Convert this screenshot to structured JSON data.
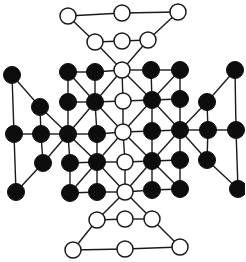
{
  "diagram": {
    "title": "",
    "type": "board-game-layout",
    "colors": {
      "black_piece": "#0d0d0d",
      "white_piece": "#ffffff",
      "line": "#1a1a1a",
      "background": "#ffffff"
    },
    "node_radius": 8,
    "nodes": [
      {
        "id": "t1",
        "x": 68,
        "y": 16,
        "color": "white"
      },
      {
        "id": "t2",
        "x": 122,
        "y": 13,
        "color": "white"
      },
      {
        "id": "t3",
        "x": 178,
        "y": 12,
        "color": "white"
      },
      {
        "id": "t4",
        "x": 95,
        "y": 42,
        "color": "white"
      },
      {
        "id": "t5",
        "x": 122,
        "y": 41,
        "color": "white"
      },
      {
        "id": "t6",
        "x": 148,
        "y": 40,
        "color": "white"
      },
      {
        "id": "g00",
        "x": 68,
        "y": 72,
        "color": "black"
      },
      {
        "id": "g01",
        "x": 95,
        "y": 72,
        "color": "black"
      },
      {
        "id": "g02",
        "x": 122,
        "y": 70,
        "color": "white"
      },
      {
        "id": "g03",
        "x": 151,
        "y": 70,
        "color": "black"
      },
      {
        "id": "g04",
        "x": 180,
        "y": 70,
        "color": "black"
      },
      {
        "id": "g10",
        "x": 68,
        "y": 102,
        "color": "black"
      },
      {
        "id": "g11",
        "x": 95,
        "y": 102,
        "color": "black"
      },
      {
        "id": "g12",
        "x": 123,
        "y": 101,
        "color": "white"
      },
      {
        "id": "g13",
        "x": 152,
        "y": 100,
        "color": "black"
      },
      {
        "id": "g14",
        "x": 180,
        "y": 99,
        "color": "black"
      },
      {
        "id": "g20",
        "x": 68,
        "y": 134,
        "color": "black"
      },
      {
        "id": "g21",
        "x": 97,
        "y": 134,
        "color": "black"
      },
      {
        "id": "g22",
        "x": 123,
        "y": 132,
        "color": "white"
      },
      {
        "id": "g23",
        "x": 152,
        "y": 131,
        "color": "black"
      },
      {
        "id": "g24",
        "x": 180,
        "y": 130,
        "color": "black"
      },
      {
        "id": "g30",
        "x": 70,
        "y": 163,
        "color": "black"
      },
      {
        "id": "g31",
        "x": 97,
        "y": 162,
        "color": "black"
      },
      {
        "id": "g32",
        "x": 125,
        "y": 162,
        "color": "white"
      },
      {
        "id": "g33",
        "x": 152,
        "y": 161,
        "color": "black"
      },
      {
        "id": "g34",
        "x": 180,
        "y": 160,
        "color": "black"
      },
      {
        "id": "g40",
        "x": 70,
        "y": 193,
        "color": "black"
      },
      {
        "id": "g41",
        "x": 97,
        "y": 192,
        "color": "black"
      },
      {
        "id": "g42",
        "x": 125,
        "y": 192,
        "color": "white"
      },
      {
        "id": "g43",
        "x": 152,
        "y": 190,
        "color": "black"
      },
      {
        "id": "g44",
        "x": 180,
        "y": 189,
        "color": "black"
      },
      {
        "id": "l1",
        "x": 12,
        "y": 75,
        "color": "black"
      },
      {
        "id": "l2",
        "x": 40,
        "y": 107,
        "color": "black"
      },
      {
        "id": "l3",
        "x": 14,
        "y": 134,
        "color": "black"
      },
      {
        "id": "l4",
        "x": 41,
        "y": 134,
        "color": "black"
      },
      {
        "id": "l5",
        "x": 43,
        "y": 163,
        "color": "black"
      },
      {
        "id": "l6",
        "x": 16,
        "y": 192,
        "color": "black"
      },
      {
        "id": "r1",
        "x": 235,
        "y": 70,
        "color": "black"
      },
      {
        "id": "r2",
        "x": 207,
        "y": 102,
        "color": "black"
      },
      {
        "id": "r3",
        "x": 208,
        "y": 130,
        "color": "black"
      },
      {
        "id": "r4",
        "x": 236,
        "y": 130,
        "color": "black"
      },
      {
        "id": "r5",
        "x": 207,
        "y": 160,
        "color": "black"
      },
      {
        "id": "r6",
        "x": 238,
        "y": 189,
        "color": "black"
      },
      {
        "id": "b4",
        "x": 97,
        "y": 220,
        "color": "white"
      },
      {
        "id": "b5",
        "x": 125,
        "y": 219,
        "color": "white"
      },
      {
        "id": "b6",
        "x": 152,
        "y": 219,
        "color": "white"
      },
      {
        "id": "b1",
        "x": 73,
        "y": 250,
        "color": "white"
      },
      {
        "id": "b2",
        "x": 125,
        "y": 249,
        "color": "white"
      },
      {
        "id": "b3",
        "x": 180,
        "y": 247,
        "color": "white"
      }
    ],
    "edges": [
      [
        "t1",
        "t2"
      ],
      [
        "t2",
        "t3"
      ],
      [
        "t1",
        "t4"
      ],
      [
        "t3",
        "t6"
      ],
      [
        "t4",
        "t5"
      ],
      [
        "t5",
        "t6"
      ],
      [
        "t4",
        "g02"
      ],
      [
        "t6",
        "g02"
      ],
      [
        "g00",
        "g01"
      ],
      [
        "g01",
        "g02"
      ],
      [
        "g02",
        "g03"
      ],
      [
        "g03",
        "g04"
      ],
      [
        "g10",
        "g11"
      ],
      [
        "g11",
        "g12"
      ],
      [
        "g12",
        "g13"
      ],
      [
        "g13",
        "g14"
      ],
      [
        "g20",
        "g21"
      ],
      [
        "g21",
        "g22"
      ],
      [
        "g22",
        "g23"
      ],
      [
        "g23",
        "g24"
      ],
      [
        "g30",
        "g31"
      ],
      [
        "g31",
        "g32"
      ],
      [
        "g32",
        "g33"
      ],
      [
        "g33",
        "g34"
      ],
      [
        "g40",
        "g41"
      ],
      [
        "g41",
        "g42"
      ],
      [
        "g42",
        "g43"
      ],
      [
        "g43",
        "g44"
      ],
      [
        "g00",
        "g10"
      ],
      [
        "g10",
        "g20"
      ],
      [
        "g20",
        "g30"
      ],
      [
        "g30",
        "g40"
      ],
      [
        "g01",
        "g11"
      ],
      [
        "g11",
        "g21"
      ],
      [
        "g21",
        "g31"
      ],
      [
        "g31",
        "g41"
      ],
      [
        "g02",
        "g12"
      ],
      [
        "g12",
        "g22"
      ],
      [
        "g22",
        "g32"
      ],
      [
        "g32",
        "g42"
      ],
      [
        "g03",
        "g13"
      ],
      [
        "g13",
        "g23"
      ],
      [
        "g23",
        "g33"
      ],
      [
        "g33",
        "g43"
      ],
      [
        "g04",
        "g14"
      ],
      [
        "g14",
        "g24"
      ],
      [
        "g24",
        "g34"
      ],
      [
        "g34",
        "g44"
      ],
      [
        "g00",
        "g11"
      ],
      [
        "g11",
        "g22"
      ],
      [
        "g22",
        "g33"
      ],
      [
        "g33",
        "g44"
      ],
      [
        "g04",
        "g13"
      ],
      [
        "g13",
        "g22"
      ],
      [
        "g22",
        "g31"
      ],
      [
        "g31",
        "g40"
      ],
      [
        "g02",
        "g11"
      ],
      [
        "g11",
        "g20"
      ],
      [
        "g20",
        "g31"
      ],
      [
        "g31",
        "g42"
      ],
      [
        "g02",
        "g13"
      ],
      [
        "g13",
        "g24"
      ],
      [
        "g24",
        "g33"
      ],
      [
        "g33",
        "g42"
      ],
      [
        "l1",
        "l2"
      ],
      [
        "l2",
        "g20"
      ],
      [
        "l1",
        "l3"
      ],
      [
        "l3",
        "l4"
      ],
      [
        "l4",
        "g20"
      ],
      [
        "l2",
        "l4"
      ],
      [
        "l4",
        "l5"
      ],
      [
        "l5",
        "g20"
      ],
      [
        "l3",
        "l6"
      ],
      [
        "l6",
        "l5"
      ],
      [
        "r1",
        "r2"
      ],
      [
        "r2",
        "g24"
      ],
      [
        "r1",
        "r4"
      ],
      [
        "r3",
        "r4"
      ],
      [
        "r3",
        "g24"
      ],
      [
        "r2",
        "r3"
      ],
      [
        "r3",
        "r5"
      ],
      [
        "r5",
        "g24"
      ],
      [
        "r4",
        "r6"
      ],
      [
        "r6",
        "r5"
      ],
      [
        "g42",
        "b4"
      ],
      [
        "g42",
        "b6"
      ],
      [
        "b4",
        "b5"
      ],
      [
        "b5",
        "b6"
      ],
      [
        "b4",
        "b1"
      ],
      [
        "b6",
        "b3"
      ],
      [
        "b1",
        "b2"
      ],
      [
        "b2",
        "b3"
      ]
    ]
  }
}
